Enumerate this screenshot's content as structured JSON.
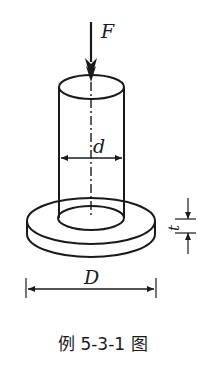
{
  "figure": {
    "caption": "例 5-3-1 图",
    "labels": {
      "force": "F",
      "inner_diameter": "d",
      "outer_diameter": "D",
      "thickness": "t"
    },
    "colors": {
      "line": "#1a1a1a",
      "background": "#ffffff"
    }
  }
}
